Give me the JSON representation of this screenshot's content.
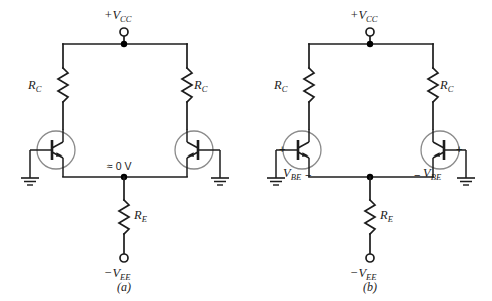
{
  "figure": {
    "type": "schematic",
    "colors": {
      "wire": "#1c1c1c",
      "transistor_envelope": "#8a8a8a",
      "background": "#ffffff",
      "node_dot": "#000000"
    },
    "captions": {
      "left": "(a)",
      "right": "(b)"
    }
  },
  "circuit_a": {
    "caption": "(a)",
    "supply_positive": {
      "prefix": "+",
      "symbol": "V",
      "subscript": "CC"
    },
    "supply_negative": {
      "prefix": "−",
      "symbol": "V",
      "subscript": "EE"
    },
    "collector_resistor_left": {
      "symbol": "R",
      "subscript": "C"
    },
    "collector_resistor_right": {
      "symbol": "R",
      "subscript": "C"
    },
    "emitter_resistor": {
      "symbol": "R",
      "subscript": "E"
    },
    "emitter_node_voltage": "≈ 0 V",
    "transistor_left": {
      "name": "Q1",
      "type": "npn"
    },
    "transistor_right": {
      "name": "Q2",
      "type": "npn"
    },
    "ground_left": "ground",
    "ground_right": "ground"
  },
  "circuit_b": {
    "caption": "(b)",
    "supply_positive": {
      "prefix": "+",
      "symbol": "V",
      "subscript": "CC"
    },
    "supply_negative": {
      "prefix": "−",
      "symbol": "V",
      "subscript": "EE"
    },
    "collector_resistor_left": {
      "symbol": "R",
      "subscript": "C"
    },
    "collector_resistor_right": {
      "symbol": "R",
      "subscript": "C"
    },
    "emitter_resistor": {
      "symbol": "R",
      "subscript": "E"
    },
    "vbe_left": {
      "symbol": "V",
      "subscript": "BE"
    },
    "vbe_right": {
      "prefix": "−",
      "symbol": "V",
      "subscript": "BE"
    },
    "polarity_left_plus": "+",
    "polarity_left_minus": "−",
    "polarity_right_plus": "+",
    "polarity_right_minus": "−",
    "transistor_left": {
      "name": "Q1",
      "type": "npn"
    },
    "transistor_right": {
      "name": "Q2",
      "type": "npn"
    },
    "ground_left": "ground",
    "ground_right": "ground"
  }
}
